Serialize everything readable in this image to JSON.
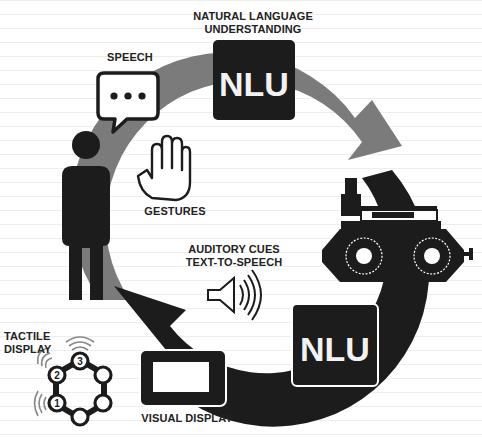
{
  "diagram": {
    "labels": {
      "nlu_top_caption_line1": "NATURAL LANGUAGE",
      "nlu_top_caption_line2": "UNDERSTANDING",
      "nlu_top_box": "NLU",
      "nlu_bottom_box": "NLU",
      "speech": "SPEECH",
      "gestures": "GESTURES",
      "auditory_line1": "AUDITORY CUES",
      "auditory_line2": "TEXT-TO-SPEECH",
      "tactile_line1": "TACTILE",
      "tactile_line2": "DISPLAY",
      "visual_display": "VISUAL DISPLAY",
      "tactile_numbers": [
        "1",
        "2",
        "3"
      ]
    },
    "icons": {
      "human": "person-icon",
      "speech": "speech-bubble-icon",
      "gesture": "raised-hand-icon",
      "robot": "wheeled-robot-icon",
      "audio": "speaker-icon",
      "screen": "display-screen-icon",
      "tactile": "tactile-ring-icon"
    },
    "flows": [
      {
        "name": "human-to-robot",
        "color": "#7a7a7a",
        "direction": "clockwise-top"
      },
      {
        "name": "robot-to-human",
        "color": "#1a1a1a",
        "direction": "clockwise-bottom"
      }
    ],
    "colors": {
      "dark": "#1c1c1c",
      "gray_arrow": "#7b7b7b",
      "background": "#ffffff",
      "text": "#222222"
    }
  }
}
